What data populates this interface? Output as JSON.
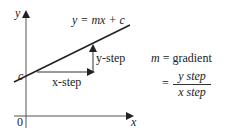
{
  "diagram": {
    "type": "straight-line-graph",
    "axes": {
      "x_label": "x",
      "y_label": "y",
      "origin_label": "0"
    },
    "line": {
      "equation": "y = mx + c",
      "intercept_label": "c"
    },
    "steps": {
      "x_step_label": "x-step",
      "y_step_label": "y-step"
    },
    "formula": {
      "line1_lhs": "m",
      "line1_rhs": "= gradient",
      "eq_sign": "=",
      "numerator": "y step",
      "denominator": "x step"
    },
    "colors": {
      "ink": "#222222",
      "axis": "#555555"
    }
  }
}
